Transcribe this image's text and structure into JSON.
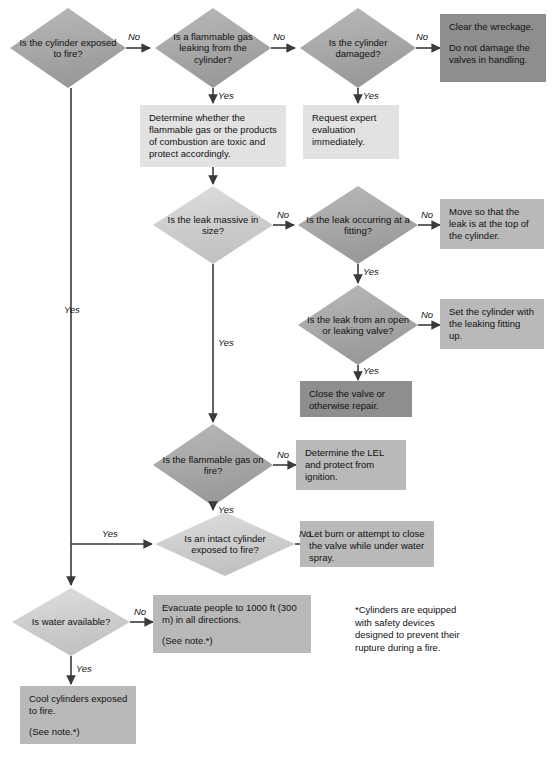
{
  "diagram": {
    "colors": {
      "diamond_light": "#cfcfcf",
      "diamond_medium": "#b0b0b0",
      "box_light": "#e2e2e2",
      "box_medium": "#b9b9b9",
      "box_dark": "#8e8e8e",
      "line": "#3a3a3a",
      "text": "#111111",
      "background": "#ffffff"
    },
    "decisions": [
      {
        "id": "d1",
        "text": "Is the cylinder exposed to fire?"
      },
      {
        "id": "d2",
        "text": "Is a flammable gas leaking from the cylinder?"
      },
      {
        "id": "d3",
        "text": "Is the cylinder damaged?"
      },
      {
        "id": "d4",
        "text": "Is the leak massive in size?"
      },
      {
        "id": "d5",
        "text": "Is the leak occurring at a fitting?"
      },
      {
        "id": "d6",
        "text": "Is the leak from an open or leaking valve?"
      },
      {
        "id": "d7",
        "text": "Is the flammable gas on fire?"
      },
      {
        "id": "d8",
        "text": "Is an intact cylinder exposed to fire?"
      },
      {
        "id": "d9",
        "text": "Is water available?"
      }
    ],
    "actions": [
      {
        "id": "a1",
        "lines": [
          "Clear the wreckage.",
          "Do not damage the valves in handling."
        ]
      },
      {
        "id": "a2",
        "lines": [
          "Determine whether the flammable gas or the products of combustion are toxic and protect accordingly."
        ]
      },
      {
        "id": "a3",
        "lines": [
          "Request expert evaluation immediately."
        ]
      },
      {
        "id": "a4",
        "lines": [
          "Move so that the leak is at the top of the cylinder."
        ]
      },
      {
        "id": "a5",
        "lines": [
          "Set the cylinder with the leaking fitting up."
        ]
      },
      {
        "id": "a6",
        "lines": [
          "Close the valve or otherwise repair."
        ]
      },
      {
        "id": "a7",
        "lines": [
          "Determine the LEL and protect from ignition."
        ]
      },
      {
        "id": "a8",
        "lines": [
          "Let burn or attempt to close the valve while under water spray."
        ]
      },
      {
        "id": "a9",
        "lines": [
          "Evacuate people to 1000 ft (300 m) in all directions.",
          "(See note.*)"
        ]
      },
      {
        "id": "a10",
        "lines": [
          "Cool cylinders exposed to fire.",
          "(See note.*)"
        ]
      }
    ],
    "edge_labels": {
      "d1_no": "No",
      "d1_yes": "Yes",
      "d2_no": "No",
      "d2_yes": "Yes",
      "d3_no": "No",
      "d3_yes": "Yes",
      "d4_no": "No",
      "d4_yes": "Yes",
      "d5_no": "No",
      "d5_yes": "Yes",
      "d6_no": "No",
      "d6_yes": "Yes",
      "d7_no": "No",
      "d7_yes": "Yes",
      "d8_no": "No",
      "d9_no": "No",
      "d9_yes": "Yes"
    },
    "footnote": {
      "lines": [
        "*Cylinders are equipped",
        "with safety devices",
        "designed to prevent their",
        "rupture during a fire."
      ]
    }
  }
}
